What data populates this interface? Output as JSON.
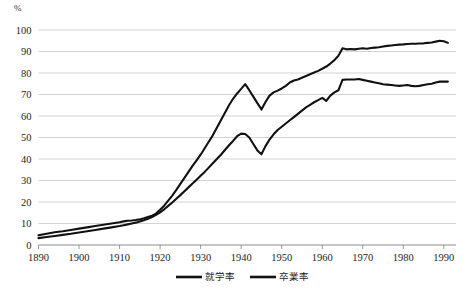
{
  "chart_data": {
    "type": "line",
    "title": "",
    "xlabel": "",
    "ylabel": "%",
    "unit_label": "%",
    "xlim": [
      1890,
      1993
    ],
    "ylim": [
      0,
      100
    ],
    "grid": true,
    "legend_position": "bottom",
    "y_ticks": [
      0,
      10,
      20,
      30,
      40,
      50,
      60,
      70,
      80,
      90,
      100
    ],
    "x_ticks": [
      1890,
      1900,
      1910,
      1920,
      1930,
      1940,
      1950,
      1960,
      1970,
      1980,
      1990
    ],
    "colors": {
      "series_line": "#111111",
      "gridline": "#c8c8c8",
      "axis": "#8d8d8d",
      "background": "#ffffff"
    },
    "series": [
      {
        "name": "就学率",
        "color": "#111111",
        "x": [
          1890,
          1892,
          1894,
          1896,
          1898,
          1900,
          1902,
          1904,
          1906,
          1908,
          1910,
          1911,
          1912,
          1913,
          1914,
          1915,
          1916,
          1917,
          1918,
          1919,
          1920,
          1921,
          1922,
          1923,
          1924,
          1925,
          1926,
          1927,
          1928,
          1929,
          1930,
          1931,
          1932,
          1933,
          1934,
          1935,
          1936,
          1937,
          1938,
          1939,
          1940,
          1941,
          1942,
          1943,
          1944,
          1945,
          1946,
          1947,
          1948,
          1949,
          1950,
          1951,
          1952,
          1953,
          1954,
          1955,
          1956,
          1957,
          1958,
          1959,
          1960,
          1961,
          1962,
          1963,
          1964,
          1965,
          1966,
          1967,
          1968,
          1969,
          1970,
          1971,
          1972,
          1973,
          1974,
          1975,
          1976,
          1977,
          1978,
          1979,
          1980,
          1981,
          1982,
          1983,
          1984,
          1985,
          1986,
          1987,
          1988,
          1989,
          1990,
          1991
        ],
        "values": [
          4.5,
          5.2,
          5.9,
          6.4,
          7.0,
          7.6,
          8.2,
          8.8,
          9.4,
          10.0,
          10.6,
          11.0,
          11.3,
          11.4,
          11.6,
          11.9,
          12.4,
          13.0,
          13.6,
          14.6,
          16.4,
          18.3,
          20.6,
          23.0,
          25.6,
          28.4,
          31.2,
          34.0,
          36.8,
          39.4,
          42.0,
          45.0,
          48.0,
          51.0,
          54.5,
          58.0,
          61.5,
          65.0,
          68.0,
          70.5,
          72.6,
          74.8,
          72.0,
          69.0,
          66.0,
          63.0,
          66.5,
          69.5,
          71.0,
          71.8,
          72.8,
          74.0,
          75.6,
          76.5,
          77.0,
          77.8,
          78.6,
          79.4,
          80.2,
          81.0,
          82.0,
          83.0,
          84.4,
          86.0,
          88.0,
          91.5,
          91.0,
          91.2,
          91.0,
          91.3,
          91.5,
          91.3,
          91.6,
          91.8,
          92.0,
          92.3,
          92.6,
          92.8,
          93.0,
          93.2,
          93.3,
          93.5,
          93.6,
          93.6,
          93.7,
          93.8,
          94.0,
          94.2,
          94.6,
          95.0,
          94.8,
          94.0
        ]
      },
      {
        "name": "卒業率",
        "color": "#111111",
        "x": [
          1890,
          1892,
          1894,
          1896,
          1898,
          1900,
          1902,
          1904,
          1906,
          1908,
          1910,
          1911,
          1912,
          1913,
          1914,
          1915,
          1916,
          1917,
          1918,
          1919,
          1920,
          1921,
          1922,
          1923,
          1924,
          1925,
          1926,
          1927,
          1928,
          1929,
          1930,
          1931,
          1932,
          1933,
          1934,
          1935,
          1936,
          1937,
          1938,
          1939,
          1940,
          1941,
          1942,
          1943,
          1944,
          1945,
          1946,
          1947,
          1948,
          1949,
          1950,
          1951,
          1952,
          1953,
          1954,
          1955,
          1956,
          1957,
          1958,
          1959,
          1960,
          1961,
          1962,
          1963,
          1964,
          1965,
          1966,
          1967,
          1968,
          1969,
          1970,
          1971,
          1972,
          1973,
          1974,
          1975,
          1976,
          1977,
          1978,
          1979,
          1980,
          1981,
          1982,
          1983,
          1984,
          1985,
          1986,
          1987,
          1988,
          1989,
          1990,
          1991
        ],
        "values": [
          3.2,
          3.7,
          4.2,
          4.7,
          5.2,
          5.8,
          6.4,
          7.0,
          7.6,
          8.2,
          8.8,
          9.2,
          9.6,
          10.0,
          10.4,
          10.9,
          11.5,
          12.2,
          13.0,
          14.0,
          15.2,
          16.6,
          18.2,
          19.8,
          21.5,
          23.2,
          25.0,
          26.8,
          28.6,
          30.4,
          32.2,
          34.0,
          36.0,
          38.0,
          40.0,
          42.0,
          44.2,
          46.4,
          48.4,
          50.6,
          51.8,
          51.6,
          50.0,
          47.0,
          44.0,
          42.2,
          46.0,
          49.0,
          51.5,
          53.5,
          55.0,
          56.5,
          58.0,
          59.5,
          61.0,
          62.5,
          64.0,
          65.2,
          66.4,
          67.4,
          68.4,
          67.0,
          69.5,
          71.0,
          72.0,
          76.8,
          77.0,
          77.0,
          77.0,
          77.2,
          76.8,
          76.4,
          76.0,
          75.6,
          75.2,
          74.8,
          74.6,
          74.4,
          74.2,
          74.0,
          74.2,
          74.4,
          74.0,
          73.8,
          74.0,
          74.4,
          74.8,
          75.0,
          75.6,
          76.0,
          76.0,
          76.0
        ]
      }
    ],
    "legend": [
      {
        "label": "就学率"
      },
      {
        "label": "卒業率"
      }
    ]
  }
}
